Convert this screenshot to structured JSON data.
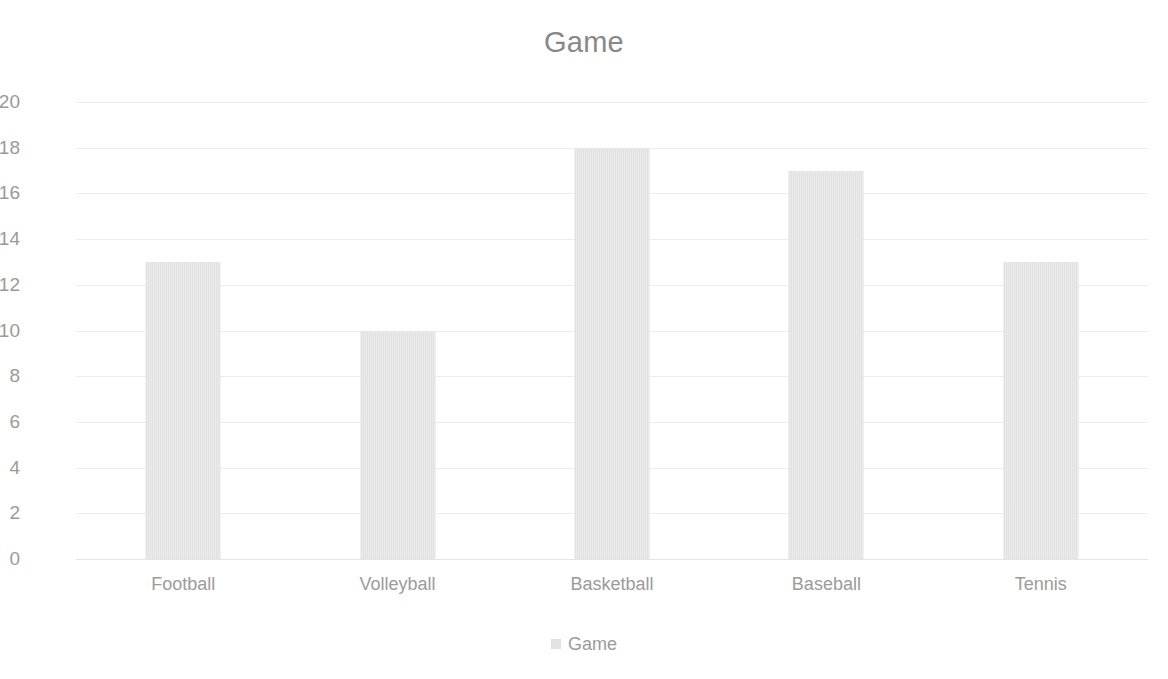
{
  "chart_data": {
    "type": "bar",
    "title": "Game",
    "xlabel": "",
    "ylabel": "",
    "categories": [
      "Football",
      "Volleyball",
      "Basketball",
      "Baseball",
      "Tennis"
    ],
    "values": [
      13,
      10,
      18,
      17,
      13
    ],
    "series": [
      {
        "name": "Game",
        "values": [
          13,
          10,
          18,
          17,
          13
        ],
        "color": "#DCDCDC"
      }
    ],
    "ylim": [
      0,
      20
    ],
    "ytick_step": 2,
    "ytick_labels": [
      "20",
      "18",
      "16",
      "14",
      "12",
      "10",
      "8",
      "6",
      "4",
      "2",
      "0"
    ],
    "grid": true,
    "grid_axis": "y",
    "legend": {
      "position": "bottom",
      "entries": [
        {
          "label": "Game",
          "swatch_name": "legend-swatch-game",
          "color": "#DCDCDC"
        }
      ]
    },
    "colors": {
      "background": "#FFFFFF",
      "bar": "#DCDCDC",
      "gridline": "#EDEDED",
      "title_text": "#888888",
      "tick_text": "#9B9B9B"
    }
  }
}
